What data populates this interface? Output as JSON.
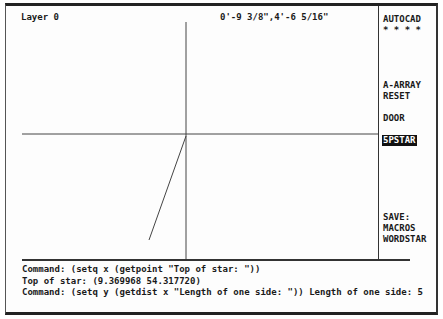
{
  "status_bar": {
    "layer": "Layer 0",
    "coordinates": "0'-9 3/8\",4'-6 5/16\""
  },
  "screen_menu": {
    "items": [
      {
        "label": "AUTOCAD",
        "selected": false
      },
      {
        "label": "* * * *",
        "selected": false
      },
      {
        "label": "A-ARRAY",
        "selected": false
      },
      {
        "label": "RESET",
        "selected": false
      },
      {
        "label": "DOOR",
        "selected": false
      },
      {
        "label": "5PSTAR",
        "selected": true
      },
      {
        "label": "SAVE:",
        "selected": false
      },
      {
        "label": "MACROS",
        "selected": false
      },
      {
        "label": "WORDSTAR",
        "selected": false
      }
    ]
  },
  "drawing": {
    "crosshair": {
      "x": 186,
      "y": 134
    },
    "line": {
      "x1": 186,
      "y1": 136,
      "x2": 149,
      "y2": 240
    }
  },
  "command_area": {
    "lines": [
      "Command: (setq x (getpoint \"Top of star: \"))",
      "Top of star: (9.369968 54.317720)",
      "Command: (setq y (getdist x \"Length of one side: \")) Length of one side: 5"
    ]
  }
}
